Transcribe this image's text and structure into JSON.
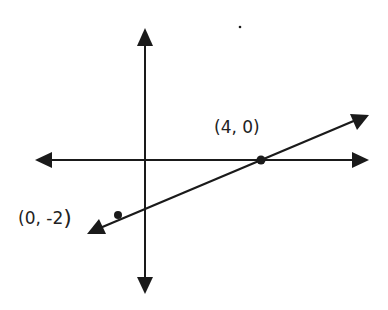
{
  "diagram": {
    "type": "coordinate-plane-line",
    "colors": {
      "ink": "#1a1a1a",
      "background": "#ffffff"
    },
    "axes": {
      "x_axis": {
        "direction": "horizontal",
        "arrows": [
          "left",
          "right"
        ]
      },
      "y_axis": {
        "direction": "vertical",
        "arrows": [
          "up",
          "down"
        ]
      }
    },
    "line": {
      "arrows": [
        "lower-left",
        "upper-right"
      ],
      "slope_sign": "positive"
    },
    "points": [
      {
        "label": "(4, 0)",
        "x": 4,
        "y": 0
      },
      {
        "label_open": "(0, -2",
        "label_close": ")",
        "x": 0,
        "y": -2
      }
    ]
  }
}
